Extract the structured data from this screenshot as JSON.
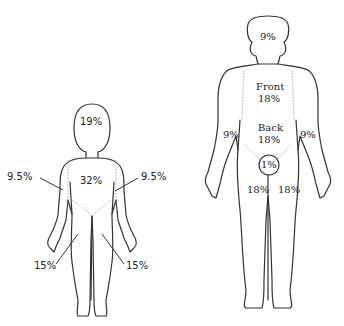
{
  "diagram": {
    "child": {
      "head": "19%",
      "trunk": "32%",
      "left_arm": "9.5%",
      "right_arm": "9.5%",
      "left_leg": "15%",
      "right_leg": "15%"
    },
    "adult": {
      "head": "9%",
      "front_label": "Front",
      "front_value": "18%",
      "back_label": "Back",
      "back_value": "18%",
      "left_arm": "9%",
      "right_arm": "9%",
      "genitals": "1%",
      "left_leg": "18%",
      "right_leg": "18%"
    },
    "colors": {
      "outline": "#333333",
      "background": "#ffffff"
    }
  }
}
